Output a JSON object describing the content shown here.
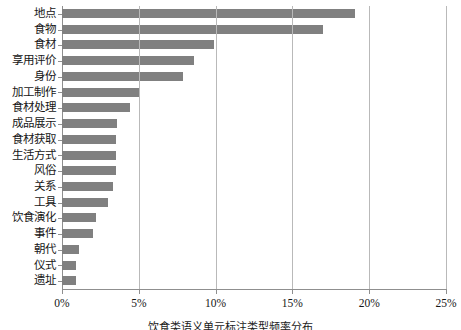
{
  "chart_data": {
    "type": "bar",
    "orientation": "horizontal",
    "title": "",
    "xlabel": "",
    "ylabel": "",
    "xlim": [
      0,
      25
    ],
    "xunit": "%",
    "grid": true,
    "legend": null,
    "bar_color": "#808080",
    "axis_color": "#8f8f8f",
    "gridline_color": "#b9b9b9",
    "xticks": [
      "0%",
      "5%",
      "10%",
      "15%",
      "20%",
      "25%"
    ],
    "xtick_values": [
      0,
      5,
      10,
      15,
      20,
      25
    ],
    "categories": [
      "地点",
      "食物",
      "食材",
      "享用评价",
      "身份",
      "加工制作",
      "食材处理",
      "成品展示",
      "食材获取",
      "生活方式",
      "风俗",
      "关系",
      "工具",
      "饮食演化",
      "事件",
      "朝代",
      "仪式",
      "遗址"
    ],
    "values": [
      19.1,
      17.0,
      9.9,
      8.6,
      7.9,
      5.0,
      4.4,
      3.6,
      3.5,
      3.5,
      3.5,
      3.3,
      3.0,
      2.2,
      2.0,
      1.1,
      0.9,
      0.9
    ]
  },
  "caption": {
    "text": "饮食类语义单元标注类型频率分布"
  }
}
